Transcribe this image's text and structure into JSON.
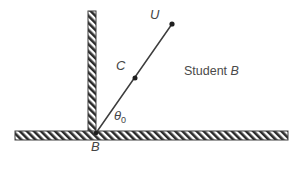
{
  "figure": {
    "background_color": "#ffffff",
    "ink_color": "#3d3d3d",
    "hatch_color": "#2b2b2b",
    "labels": {
      "launch_point": "B",
      "midpoint": "C",
      "velocity_point": "U",
      "angle": "θ",
      "angle_subscript": "0",
      "caption": "Student ",
      "caption_italic": "B"
    },
    "geometry": {
      "wall": {
        "x": 88,
        "y": 11,
        "width": 8,
        "height": 122,
        "hatch": "diagonal-forward"
      },
      "ground": {
        "x": 15,
        "y": 131,
        "width": 273,
        "height": 9,
        "hatch": "diagonal-forward"
      },
      "velocity_line": {
        "x1": 96,
        "y1": 133,
        "x2": 172,
        "y2": 24
      },
      "points": [
        {
          "name": "B",
          "x": 96,
          "y": 133,
          "radius": 2.2
        },
        {
          "name": "C",
          "x": 135,
          "y": 78,
          "radius": 2.4
        },
        {
          "name": "U",
          "x": 172,
          "y": 24,
          "radius": 2.4
        }
      ],
      "angle_arc": {
        "cx": 96,
        "cy": 133,
        "radius": 26,
        "from_deg": 0,
        "to_deg": 55
      }
    }
  }
}
